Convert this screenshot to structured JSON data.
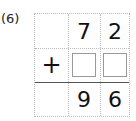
{
  "problem": {
    "label": "(6)",
    "top_row": [
      "",
      "7",
      "2"
    ],
    "operator": "+",
    "answer_boxes": [
      "",
      ""
    ],
    "result_row": [
      "",
      "9",
      "6"
    ]
  }
}
